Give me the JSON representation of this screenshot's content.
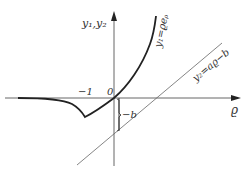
{
  "diagram": {
    "type": "function-graph",
    "axes": {
      "y_label": "y₁,y₂",
      "x_label": "ϱ",
      "origin_label": "0",
      "x_tick_label": "−1"
    },
    "curves": [
      {
        "id": "y1",
        "label": "y₁=ϱeᵨ",
        "style": "thick"
      },
      {
        "id": "y2",
        "label": "y₂=aϱ−b",
        "style": "thin"
      }
    ],
    "annotation": {
      "label": "−b"
    },
    "colors": {
      "stroke": "#333333",
      "background": "#ffffff"
    }
  }
}
